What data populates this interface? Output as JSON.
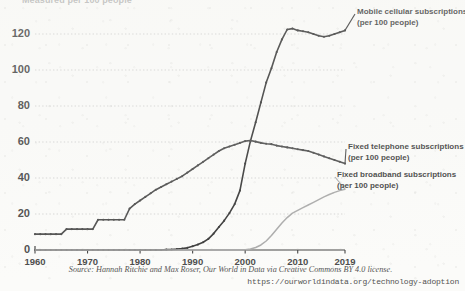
{
  "chart_data": {
    "type": "line",
    "title": "Measured per 100 people",
    "xlabel": "",
    "ylabel": "",
    "xlim": [
      1960,
      2019
    ],
    "ylim": [
      0,
      130
    ],
    "grid": true,
    "grid_style": "dotted-horizontal",
    "legend_position": "right-inline",
    "x_ticks": [
      1960,
      1970,
      1980,
      1990,
      2000,
      2010,
      2019
    ],
    "y_ticks": [
      0,
      20,
      40,
      60,
      80,
      100,
      120
    ],
    "x": [
      1960,
      1961,
      1962,
      1963,
      1964,
      1965,
      1966,
      1967,
      1968,
      1969,
      1970,
      1971,
      1972,
      1973,
      1974,
      1975,
      1976,
      1977,
      1978,
      1979,
      1980,
      1981,
      1982,
      1983,
      1984,
      1985,
      1986,
      1987,
      1988,
      1989,
      1990,
      1991,
      1992,
      1993,
      1994,
      1995,
      1996,
      1997,
      1998,
      1999,
      2000,
      2001,
      2002,
      2003,
      2004,
      2005,
      2006,
      2007,
      2008,
      2009,
      2010,
      2011,
      2012,
      2013,
      2014,
      2015,
      2016,
      2017,
      2018,
      2019
    ],
    "series": [
      {
        "name": "Mobile cellular subscriptions (per 100 people)",
        "label_line1": "Mobile cellular subscriptions",
        "label_line2": "(per 100 people)",
        "color": "#111111",
        "markers": true,
        "values": [
          0,
          0,
          0,
          0,
          0,
          0,
          0,
          0,
          0,
          0,
          0,
          0,
          0,
          0,
          0,
          0,
          0,
          0,
          0,
          0,
          0,
          0,
          0,
          0,
          0,
          0.2,
          0.3,
          0.5,
          0.8,
          1.2,
          2.1,
          3.0,
          4.3,
          6.2,
          9.1,
          12.8,
          16.3,
          20.5,
          25.5,
          33.0,
          48.0,
          60.5,
          71.0,
          82.0,
          93.0,
          101.0,
          110.0,
          117.0,
          122.5,
          123.0,
          122.0,
          121.5,
          121.0,
          120.0,
          119.0,
          118.5,
          119.0,
          120.0,
          121.0,
          122.0
        ]
      },
      {
        "name": "Fixed telephone subscriptions (per 100 people)",
        "label_line1": "Fixed telephone subscriptions",
        "label_line2": "(per 100 people)",
        "color": "#2a2a2a",
        "markers": true,
        "values": [
          8.8,
          8.8,
          8.8,
          8.8,
          8.8,
          8.8,
          11.6,
          11.6,
          11.6,
          11.6,
          11.6,
          11.6,
          16.8,
          16.8,
          16.8,
          16.8,
          16.8,
          16.8,
          23.0,
          25.5,
          27.5,
          29.5,
          31.5,
          33.5,
          35.0,
          36.5,
          38.0,
          39.5,
          41.0,
          43.0,
          45.0,
          47.0,
          49.0,
          51.0,
          53.0,
          55.0,
          56.5,
          57.5,
          58.5,
          59.5,
          60.5,
          60.8,
          60.2,
          59.5,
          59.0,
          58.8,
          58.0,
          57.5,
          57.0,
          56.5,
          56.0,
          55.5,
          55.0,
          54.0,
          53.0,
          52.0,
          51.0,
          50.0,
          49.0,
          48.0
        ]
      },
      {
        "name": "Fixed broadband subscriptions (per 100 people)",
        "label_line1": "Fixed broadband subscriptions",
        "label_line2": "(per 100 people)",
        "color": "#9a9a9a",
        "markers": false,
        "values": [
          0,
          0,
          0,
          0,
          0,
          0,
          0,
          0,
          0,
          0,
          0,
          0,
          0,
          0,
          0,
          0,
          0,
          0,
          0,
          0,
          0,
          0,
          0,
          0,
          0,
          0,
          0,
          0,
          0,
          0,
          0,
          0,
          0,
          0,
          0,
          0,
          0,
          0,
          0,
          0,
          0.2,
          0.6,
          1.4,
          2.8,
          5.0,
          8.0,
          11.5,
          15.0,
          18.0,
          20.5,
          22.0,
          23.5,
          25.0,
          26.5,
          28.0,
          29.5,
          30.8,
          32.0,
          33.0,
          33.8
        ]
      }
    ],
    "source_note": "Source: Hannah Ritchie and Max Roser, Our World in Data via Creative Commons BY 4.0 license.",
    "source_url": "https://ourworldindata.org/technology-adoption"
  }
}
